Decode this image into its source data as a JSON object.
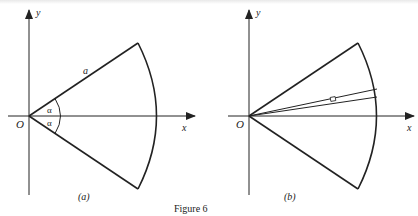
{
  "figure": {
    "caption": "Figure 6",
    "panels": [
      {
        "id": "a",
        "label": "(a)",
        "origin_label": "O",
        "x_axis_label": "x",
        "y_axis_label": "y",
        "radius_label": "a",
        "angle_labels": [
          "α",
          "α"
        ],
        "description": "Circular sector of radius a, symmetric about the x-axis, half-angle α above and below"
      },
      {
        "id": "b",
        "label": "(b)",
        "origin_label": "O",
        "x_axis_label": "x",
        "y_axis_label": "y",
        "description": "Same sector with a thin elemental strip between two rays near the x-axis, marked with a small element box"
      }
    ]
  },
  "colors": {
    "ink": "#222222",
    "background": "#ffffff"
  }
}
